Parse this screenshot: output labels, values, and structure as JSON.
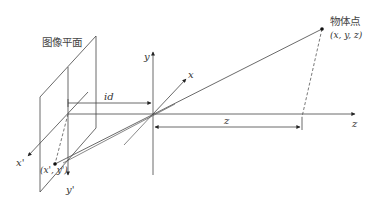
{
  "diagram": {
    "type": "pinhole-camera-projection",
    "labels": {
      "image_plane": "图像平面",
      "object_point_title": "物体点",
      "object_point_coords": "(x, y, z)",
      "image_point_coords": "(x', y')",
      "axis_x": "x",
      "axis_y": "y",
      "axis_z": "z",
      "axis_x_prime": "x'",
      "axis_y_prime": "y'",
      "dim_id": "id",
      "dim_z": "z"
    },
    "colors": {
      "line": "#333333",
      "background": "#ffffff"
    }
  }
}
